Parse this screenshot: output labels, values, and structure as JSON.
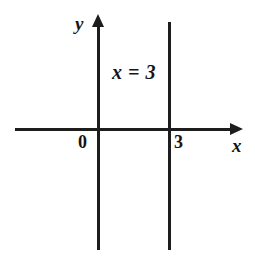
{
  "figure": {
    "background_color": "#ffffff",
    "stroke_color": "#1d1d1d",
    "text_color": "#151515",
    "width": 255,
    "height": 260
  },
  "axes": {
    "y_axis_label": "y",
    "x_axis_label": "x",
    "origin_label": "0",
    "x_tick_label": "3",
    "y_arrow_direction": "up",
    "x_arrow_direction": "right"
  },
  "annotations": {
    "equation": "x = 3"
  },
  "chart_data": {
    "type": "line",
    "title": "",
    "xlabel": "x",
    "ylabel": "y",
    "grid": false,
    "legend": "none",
    "xlim": [
      -3.5,
      5.5
    ],
    "ylim": [
      -4.2,
      3.2
    ],
    "xticks": [
      0,
      3
    ],
    "xticklabels": [
      "0",
      "3"
    ],
    "yticks": [],
    "yticklabels": [],
    "series": [
      {
        "name": "x = 3",
        "equation": "x = 3",
        "type": "vertical-line",
        "x": 3,
        "y_range": [
          -4.2,
          3.2
        ],
        "color": "#1d1d1d"
      }
    ],
    "annotations": [
      {
        "text": "x = 3",
        "x": 1.35,
        "y": 2.0
      }
    ]
  }
}
